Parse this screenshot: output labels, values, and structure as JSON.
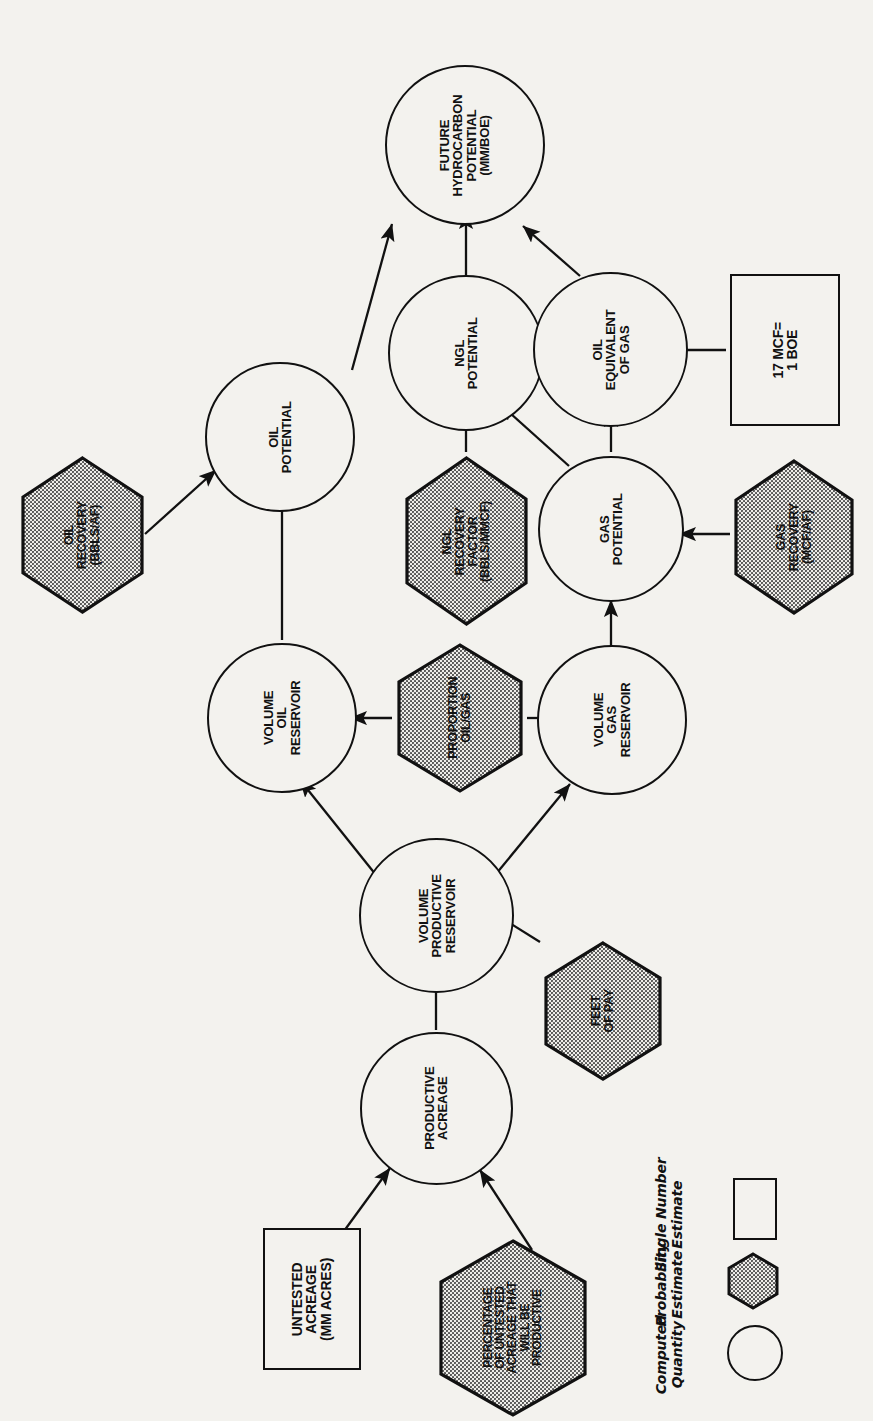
{
  "figure": {
    "type": "influence-diagram",
    "orientation": "rotated-90-ccw",
    "nodes": {
      "future_hydrocarbon_potential": "FUTURE\nHYDROCARBON\nPOTENTIAL\n(MM/BOE)",
      "oil_potential": "OIL\nPOTENTIAL",
      "ngl_potential": "NGL\nPOTENTIAL",
      "oil_equivalent_of_gas": "OIL\nEQUIVALENT\nOF GAS",
      "gas_potential": "GAS\nPOTENTIAL",
      "volume_oil_reservoir": "VOLUME\nOIL\nRESERVOIR",
      "volume_gas_reservoir": "VOLUME\nGAS\nRESERVOIR",
      "volume_productive_reservoir": "VOLUME\nPRODUCTIVE\nRESERVOIR",
      "productive_acreage": "PRODUCTIVE\nACREAGE"
    },
    "boxes": {
      "conversion_factor": "17 MCF=\n1 BOE",
      "untested_acreage": "UNTESTED\nACREAGE\n(MM ACRES)"
    },
    "hexes": {
      "oil_recovery": "OIL\nRECOVERY\n(BBLS/AF)",
      "ngl_recovery_factor": "NGL\nRECOVERY\nFACTOR\n(BBLS/MMCF)",
      "gas_recovery": "GAS\nRECOVERY\n(MCF/AF)",
      "proportion_oil_gas": "PROPORTION\nOIL/GAS",
      "feet_of_pay": "FEET\nOF PAY",
      "percentage_productive": "PERCENTAGE\nOF UNTESTED\nACREAGE THAT\nWILL BE\nPRODUCTIVE"
    },
    "legend": {
      "items": [
        {
          "label": "Single Number\nEstimate",
          "shape": "rectangle"
        },
        {
          "label": "Probability\nEstimate",
          "shape": "hexagon"
        },
        {
          "label": "Computed\nQuantity",
          "shape": "circle"
        }
      ]
    },
    "colors": {
      "ink": "#111111",
      "paper": "#f3f2ee",
      "hex_fill": "#9a9a9a"
    }
  }
}
